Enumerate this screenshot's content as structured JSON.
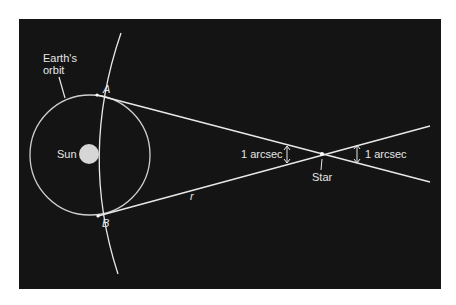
{
  "figure": {
    "labels": {
      "orbit": "Earth's\norbit",
      "orbit_line1": "Earth's",
      "orbit_line2": "orbit",
      "sun": "Sun",
      "point_a": "A",
      "point_b": "B",
      "distance": "r",
      "star": "Star",
      "angle_left": "1 arcsec",
      "angle_right": "1 arcsec"
    },
    "colors": {
      "background": "#141414",
      "lines": "#e8e8e8",
      "orbit": "#cfcfcf",
      "sun": "#d6d6d6",
      "page": "#ffffff"
    }
  }
}
